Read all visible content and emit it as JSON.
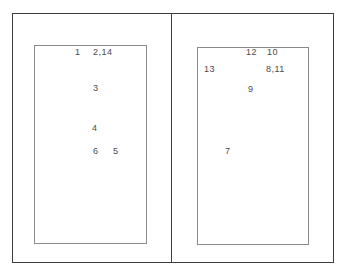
{
  "figure": {
    "panels": [
      {
        "id": "left",
        "labels": [
          {
            "text": "1",
            "x": 75,
            "y": 48
          },
          {
            "text": "2,14",
            "x": 93,
            "y": 48
          },
          {
            "text": "3",
            "x": 93,
            "y": 84
          },
          {
            "text": "4",
            "x": 92,
            "y": 124
          },
          {
            "text": "6",
            "x": 93,
            "y": 147
          },
          {
            "text": "5",
            "x": 113,
            "y": 147
          }
        ]
      },
      {
        "id": "right",
        "labels": [
          {
            "text": "12",
            "x": 246,
            "y": 48
          },
          {
            "text": "10",
            "x": 267,
            "y": 48
          },
          {
            "text": "13",
            "x": 204,
            "y": 65
          },
          {
            "text": "8,11",
            "x": 266,
            "y": 65
          },
          {
            "text": "9",
            "x": 248,
            "y": 85
          },
          {
            "text": "7",
            "x": 225,
            "y": 147
          }
        ]
      }
    ]
  }
}
